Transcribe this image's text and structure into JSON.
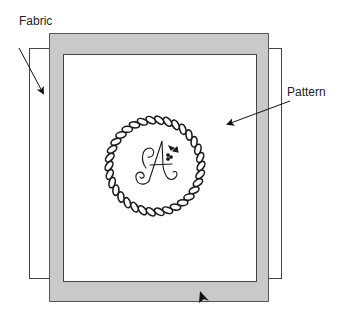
{
  "diagram": {
    "labels": {
      "fabric": "Fabric",
      "pattern": "Pattern"
    },
    "monogram": "A",
    "colors": {
      "frame_fill": "#c8c8c8",
      "frame_stroke": "#555555",
      "fabric_stroke": "#444444",
      "ink": "#1a1a1a"
    }
  }
}
